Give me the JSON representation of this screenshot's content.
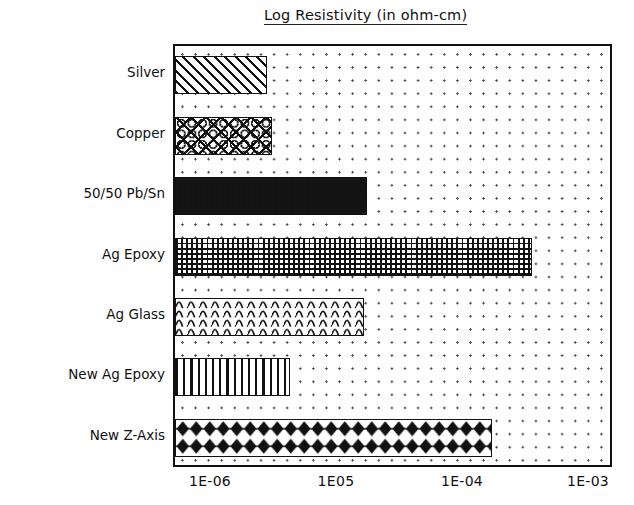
{
  "chart_data": {
    "type": "bar",
    "orientation": "horizontal",
    "title": "Log Resistivity (in ohm-cm)",
    "xlabel": "",
    "ylabel": "",
    "grid": "dotted",
    "legend": "none",
    "x_axis": {
      "scale": "log",
      "tick_labels": [
        "1E-06",
        "1E05",
        "1E-04",
        "1E-03"
      ],
      "tick_values": [
        1e-06,
        1e-05,
        0.0001,
        0.001
      ],
      "xlim": [
        "1E-06 minus half decade",
        "1E-03 plus quarter decade"
      ],
      "tick_px": [
        210,
        336,
        462,
        588
      ],
      "decade_px": 126
    },
    "categories": [
      "Silver",
      "Copper",
      "50/50 Pb/Sn",
      "Ag Epoxy",
      "Ag Glass",
      "New Ag Epoxy",
      "New Z-Axis"
    ],
    "values": [
      1.4e-06,
      1.9e-06,
      2.1e-05,
      0.00016,
      1.8e-05,
      3.6e-06,
      6.2e-05
    ],
    "bar_end_px": [
      265,
      270,
      365,
      530,
      362,
      288,
      490
    ],
    "patterns": [
      "diagonal-hatch",
      "circle-lattice",
      "dark-with-white-dots",
      "fine-crosshatch-grid",
      "wavy-lines",
      "vertical-stripes",
      "diamond-chain"
    ],
    "colors": {
      "ink": "#111111",
      "background": "#ffffff",
      "grid_dot": "#4a4a4a"
    }
  }
}
